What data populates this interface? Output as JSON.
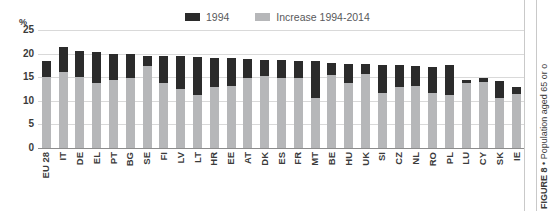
{
  "chart_data": {
    "type": "bar",
    "title": "",
    "subtitle": "",
    "xlabel": "",
    "ylabel": "%",
    "ylim": [
      0,
      25
    ],
    "yticks": [
      0,
      5,
      10,
      15,
      20,
      25
    ],
    "grid": true,
    "stacked": true,
    "legend_position": "top-center",
    "categories": [
      "EU 28",
      "IT",
      "DE",
      "EL",
      "PT",
      "BG",
      "SE",
      "FI",
      "LV",
      "LT",
      "HR",
      "EE",
      "AT",
      "DK",
      "ES",
      "FR",
      "MT",
      "BE",
      "HU",
      "UK",
      "SI",
      "CZ",
      "NL",
      "RO",
      "PL",
      "LU",
      "CY",
      "SK",
      "IE"
    ],
    "series": [
      {
        "name": "1994",
        "color": "#2b2b2b",
        "values": [
          15.0,
          16.2,
          15.1,
          13.8,
          14.5,
          14.9,
          17.4,
          13.8,
          12.4,
          11.3,
          12.9,
          13.2,
          14.9,
          15.3,
          14.8,
          14.9,
          10.5,
          15.5,
          13.7,
          15.7,
          11.6,
          12.9,
          13.1,
          11.6,
          11.2,
          13.8,
          14.0,
          10.5,
          11.4
        ]
      },
      {
        "name": "Increase 1994-2014",
        "color": "#b6b7b9",
        "values": [
          3.4,
          5.2,
          5.5,
          6.5,
          5.5,
          5.0,
          2.2,
          5.8,
          7.0,
          7.9,
          6.2,
          5.8,
          3.9,
          3.4,
          3.8,
          3.6,
          7.9,
          2.6,
          4.2,
          2.0,
          5.9,
          4.6,
          4.2,
          5.5,
          6.3,
          0.7,
          0.8,
          3.6,
          1.6
        ]
      }
    ],
    "totals": [
      18.4,
      21.4,
      20.6,
      20.3,
      20.0,
      19.9,
      19.6,
      19.6,
      19.4,
      19.2,
      19.1,
      19.0,
      18.8,
      18.7,
      18.6,
      18.5,
      18.4,
      18.1,
      17.9,
      17.7,
      17.5,
      17.5,
      17.3,
      17.1,
      17.5,
      14.5,
      14.8,
      14.1,
      13.0
    ]
  },
  "legend": {
    "items": [
      {
        "label": "1994",
        "color": "#2b2b2b"
      },
      {
        "label": "Increase 1994-2014",
        "color": "#b6b7b9"
      }
    ]
  },
  "axis": {
    "unit_label": "%",
    "yticks": [
      "25",
      "20",
      "15",
      "10",
      "5",
      "0"
    ]
  },
  "caption": {
    "figure_number": "FIGURE 8",
    "separator": " • ",
    "text": "Population aged 65 or o"
  }
}
